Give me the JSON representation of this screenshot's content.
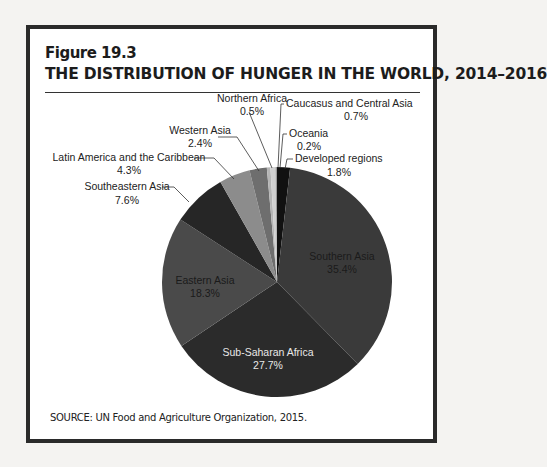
{
  "figure": {
    "label": "Figure 19.3",
    "title": "THE DISTRIBUTION OF HUNGER IN THE WORLD, 2014–2016",
    "source": "SOURCE: UN Food and Agriculture Organization, 2015."
  },
  "chart_data": {
    "type": "pie",
    "title": "THE DISTRIBUTION OF HUNGER IN THE WORLD, 2014–2016",
    "start_angle": "12 o'clock, clockwise",
    "slices": [
      {
        "name": "Developed regions",
        "value": 1.8,
        "label": "1.8%",
        "color": "#111111"
      },
      {
        "name": "Southern Asia",
        "value": 35.4,
        "label": "35.4%",
        "color": "#3a3a3a"
      },
      {
        "name": "Sub-Saharan Africa",
        "value": 27.7,
        "label": "27.7%",
        "color": "#2b2b2b"
      },
      {
        "name": "Eastern Asia",
        "value": 18.3,
        "label": "18.3%",
        "color": "#4a4a4a"
      },
      {
        "name": "Southeastern Asia",
        "value": 7.6,
        "label": "7.6%",
        "color": "#262626"
      },
      {
        "name": "Latin America and the Caribbean",
        "value": 4.3,
        "label": "4.3%",
        "color": "#8c8c8c"
      },
      {
        "name": "Western Asia",
        "value": 2.4,
        "label": "2.4%",
        "color": "#6e6e6e"
      },
      {
        "name": "Northern Africa",
        "value": 0.5,
        "label": "0.5%",
        "color": "#b5b5b5"
      },
      {
        "name": "Caucasus and Central Asia",
        "value": 0.7,
        "label": "0.7%",
        "color": "#d0d0d0"
      },
      {
        "name": "Oceania",
        "value": 0.2,
        "label": "0.2%",
        "color": "#9a9a9a"
      }
    ]
  },
  "labels": {
    "northern_africa": {
      "name": "Northern Africa",
      "pct": "0.5%"
    },
    "caucasus": {
      "name": "Caucasus and Central Asia",
      "pct": "0.7%"
    },
    "western_asia": {
      "name": "Western Asia",
      "pct": "2.4%"
    },
    "oceania": {
      "name": "Oceania",
      "pct": "0.2%"
    },
    "latin_america": {
      "name": "Latin America and the Caribbean",
      "pct": "4.3%"
    },
    "developed": {
      "name": "Developed regions",
      "pct": "1.8%"
    },
    "southeastern_asia": {
      "name": "Southeastern Asia",
      "pct": "7.6%"
    },
    "southern_asia": {
      "name": "Southern Asia",
      "pct": "35.4%"
    },
    "eastern_asia": {
      "name": "Eastern Asia",
      "pct": "18.3%"
    },
    "sub_saharan": {
      "name": "Sub-Saharan Africa",
      "pct": "27.7%"
    }
  }
}
